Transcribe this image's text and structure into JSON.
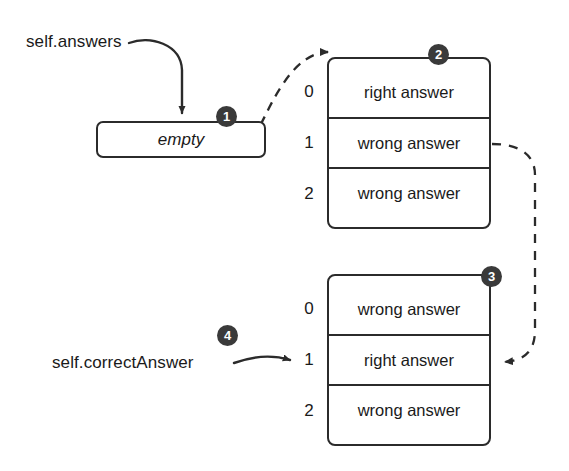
{
  "diagram": {
    "background_color": "#ffffff",
    "ink_color": "#2b2b2b",
    "badge_color": "#3a3a3a",
    "badge_text_color": "#ffffff"
  },
  "labels": {
    "self_answers": "self.answers",
    "self_correct_answer": "self.correctAnswer"
  },
  "empty_box": {
    "value": "empty",
    "style": "italic",
    "badge": "1"
  },
  "arrays": [
    {
      "badge": "2",
      "indices": [
        "0",
        "1",
        "2"
      ],
      "cells": [
        "right answer",
        "wrong answer",
        "wrong answer"
      ]
    },
    {
      "badge": "3",
      "indices": [
        "0",
        "1",
        "2"
      ],
      "cells": [
        "wrong answer",
        "right answer",
        "wrong answer"
      ]
    }
  ],
  "badges": {
    "one": "1",
    "two": "2",
    "three": "3",
    "four": "4"
  },
  "connectors": [
    {
      "name": "self-answers-to-empty-box",
      "style": "solid",
      "from": "self.answers",
      "to": "empty"
    },
    {
      "name": "empty-box-to-array-one",
      "style": "dashed",
      "from": "empty",
      "to": "array 2"
    },
    {
      "name": "array-one-row-one-to-array-two-row-one",
      "style": "dashed",
      "from": "array 2 index 1",
      "to": "array 3 index 1"
    },
    {
      "name": "self-correct-answer-to-index-one",
      "style": "solid",
      "from": "self.correctAnswer",
      "to": "array 3 index 1"
    }
  ]
}
